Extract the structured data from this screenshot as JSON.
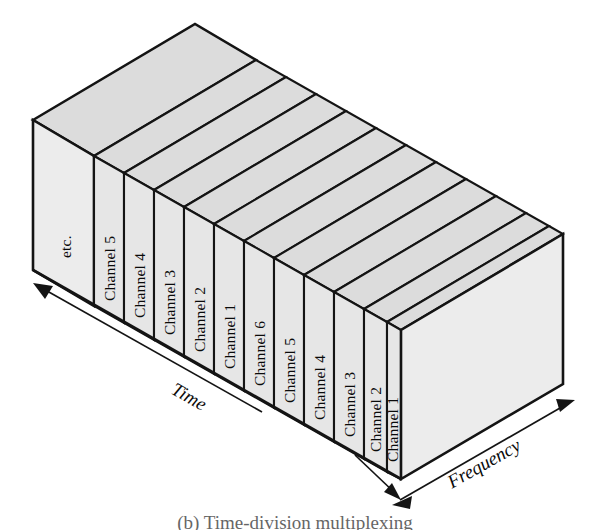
{
  "figure": {
    "caption": "(b) Time-division multiplexing",
    "type": "isometric-3d-block-diagram",
    "background_color": "#ffffff",
    "line_color": "#141414",
    "face_fill": "#e6e6e6",
    "top_fill": "#dcdcdc",
    "axes": [
      {
        "name": "time-axis",
        "label": "Time",
        "arrow": "single",
        "direction": "up-left",
        "position": "lower-left-edge"
      },
      {
        "name": "frequency-axis",
        "label": "Frequency",
        "arrow": "double",
        "direction": "down-left-up-right",
        "position": "lower-right-edge"
      }
    ],
    "front_slabs": [
      {
        "index": 0,
        "label": "etc.",
        "name": "slab-etc"
      },
      {
        "index": 1,
        "label": "Channel 5",
        "name": "slab-channel-5-a"
      },
      {
        "index": 2,
        "label": "Channel 4",
        "name": "slab-channel-4-a"
      },
      {
        "index": 3,
        "label": "Channel 3",
        "name": "slab-channel-3-a"
      },
      {
        "index": 4,
        "label": "Channel 2",
        "name": "slab-channel-2-a"
      },
      {
        "index": 5,
        "label": "Channel 1",
        "name": "slab-channel-1-a"
      },
      {
        "index": 6,
        "label": "Channel 6",
        "name": "slab-channel-6-b"
      },
      {
        "index": 7,
        "label": "Channel 5",
        "name": "slab-channel-5-b"
      },
      {
        "index": 8,
        "label": "Channel 4",
        "name": "slab-channel-4-b"
      },
      {
        "index": 9,
        "label": "Channel 3",
        "name": "slab-channel-3-b"
      },
      {
        "index": 10,
        "label": "Channel 2",
        "name": "slab-channel-2-b"
      },
      {
        "index": 11,
        "label": "Channel 1",
        "name": "slab-channel-1-b"
      }
    ]
  }
}
